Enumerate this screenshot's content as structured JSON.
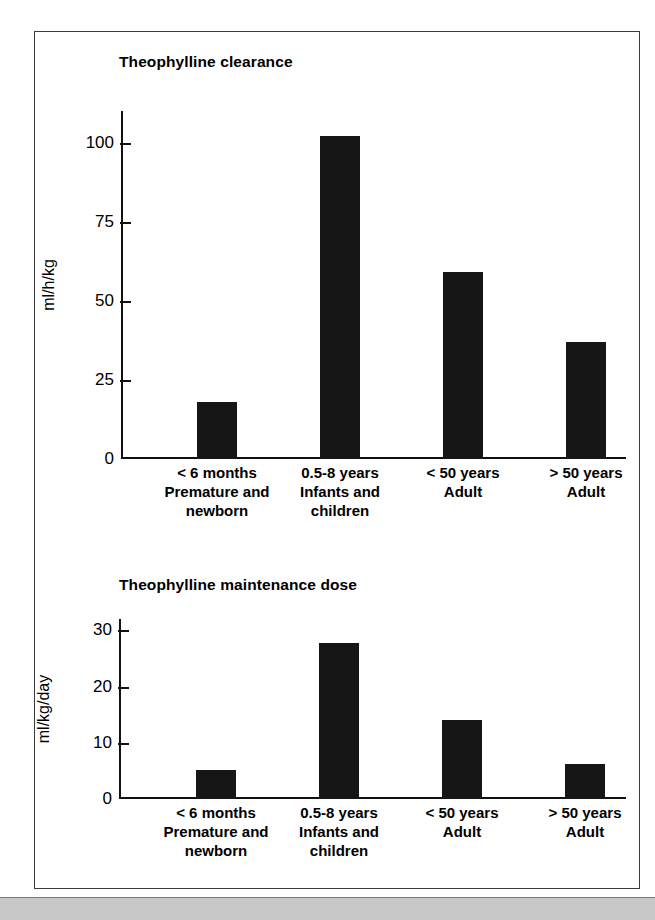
{
  "figure": {
    "background_color": "#ffffff",
    "frame_color": "#3b3b3b",
    "bar_color": "#161616",
    "scan_strip_color": "#c8c8c8"
  },
  "chart_data": [
    {
      "type": "bar",
      "title": "Theophylline clearance",
      "xlabel": "",
      "ylabel": "ml/h/kg",
      "ylim": [
        0,
        110
      ],
      "yticks": [
        0,
        25,
        50,
        75,
        100
      ],
      "ytick_labels": [
        "0",
        "25",
        "50",
        "75",
        "100"
      ],
      "grid": false,
      "legend": false,
      "categories": [
        "< 6 months\nPremature and\nnewborn",
        "0.5-8 years\nInfants and\nchildren",
        "< 50 years\nAdult",
        "> 50 years\nAdult"
      ],
      "category_lines": [
        [
          "< 6 months",
          "Premature and",
          "newborn"
        ],
        [
          "0.5-8 years",
          "Infants and",
          "children"
        ],
        [
          "< 50 years",
          "Adult",
          ""
        ],
        [
          "> 50 years",
          "Adult",
          ""
        ]
      ],
      "values": [
        18,
        102,
        59,
        37
      ]
    },
    {
      "type": "bar",
      "title": "Theophylline maintenance dose",
      "xlabel": "",
      "ylabel": "ml/kg/day",
      "ylim": [
        0,
        32
      ],
      "yticks": [
        0,
        10,
        20,
        30
      ],
      "ytick_labels": [
        "0",
        "10",
        "20",
        "30"
      ],
      "grid": false,
      "legend": false,
      "categories": [
        "< 6 months\nPremature and\nnewborn",
        "0.5-8 years\nInfants and\nchildren",
        "< 50 years\nAdult",
        "> 50 years\nAdult"
      ],
      "category_lines": [
        [
          "< 6 months",
          "Premature and",
          "newborn"
        ],
        [
          "0.5-8 years",
          "Infants and",
          "children"
        ],
        [
          "< 50 years",
          "Adult",
          ""
        ],
        [
          "> 50 years",
          "Adult",
          ""
        ]
      ],
      "values": [
        5.2,
        27.8,
        14.1,
        6.2
      ]
    }
  ]
}
